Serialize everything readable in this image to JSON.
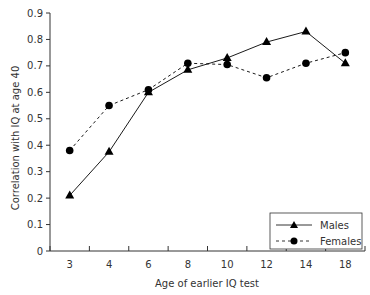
{
  "chart_data": {
    "type": "line",
    "title": "",
    "xlabel": "Age of earlier IQ test",
    "ylabel": "Correlation with IQ at age 40",
    "categories": [
      "3",
      "4",
      "6",
      "8",
      "10",
      "12",
      "14",
      "18"
    ],
    "ylim": [
      0,
      0.9
    ],
    "yticks": [
      "0",
      "0.1",
      "0.2",
      "0.3",
      "0.4",
      "0.5",
      "0.6",
      "0.7",
      "0.8",
      "0.9"
    ],
    "grid": false,
    "legend_position": "lower right",
    "series": [
      {
        "name": "Males",
        "line_style": "solid",
        "marker": "triangle",
        "values": [
          0.21,
          0.375,
          0.6,
          0.685,
          0.73,
          0.79,
          0.83,
          0.71
        ]
      },
      {
        "name": "Females",
        "line_style": "dashed",
        "marker": "circle",
        "values": [
          0.38,
          0.55,
          0.61,
          0.71,
          0.705,
          0.655,
          0.71,
          0.75
        ]
      }
    ]
  },
  "colors": {
    "axis": "#333333",
    "series": "#000000",
    "background": "#ffffff"
  }
}
